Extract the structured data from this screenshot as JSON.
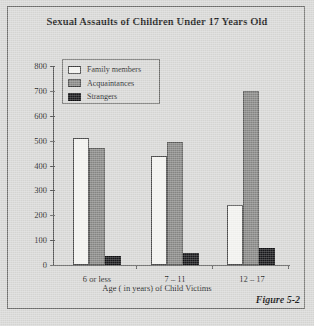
{
  "figure": {
    "title": "Sexual Assaults of Children Under 17 Years Old",
    "caption": "Figure 5-2",
    "xaxis_title": "Age ( in years) of Child Victims"
  },
  "legend": {
    "items": [
      {
        "label": "Family members",
        "swatch": "legend-swatch-family",
        "color": "#f4f4f1"
      },
      {
        "label": "Acquaintances",
        "swatch": "legend-swatch-acquaintances",
        "color": "#878785"
      },
      {
        "label": "Strangers",
        "swatch": "legend-swatch-strangers",
        "color": "#17171a"
      }
    ]
  },
  "yaxis": {
    "ticks": [
      "800",
      "700",
      "600",
      "500",
      "400",
      "300",
      "200",
      "100",
      "0"
    ]
  },
  "chart_data": {
    "type": "bar",
    "title": "Sexual Assaults of Children Under 17 Years Old",
    "subtitle": "",
    "xlabel": "Age ( in years) of Child Victims",
    "ylabel": "",
    "categories": [
      "6 or less",
      "7 – 11",
      "12 – 17"
    ],
    "series": [
      {
        "name": "Family members",
        "color": "#f4f4f1",
        "values": [
          510,
          440,
          240
        ]
      },
      {
        "name": "Acquaintances",
        "color": "#878785",
        "values": [
          470,
          495,
          700
        ]
      },
      {
        "name": "Strangers",
        "color": "#17171a",
        "values": [
          35,
          50,
          70
        ]
      }
    ],
    "ylim": [
      0,
      800
    ],
    "ytick_step": 100,
    "yticks": [
      0,
      100,
      200,
      300,
      400,
      500,
      600,
      700,
      800
    ],
    "grid": false,
    "legend_position": "upper-left-inside",
    "annotations": [
      "Figure 5-2"
    ]
  }
}
